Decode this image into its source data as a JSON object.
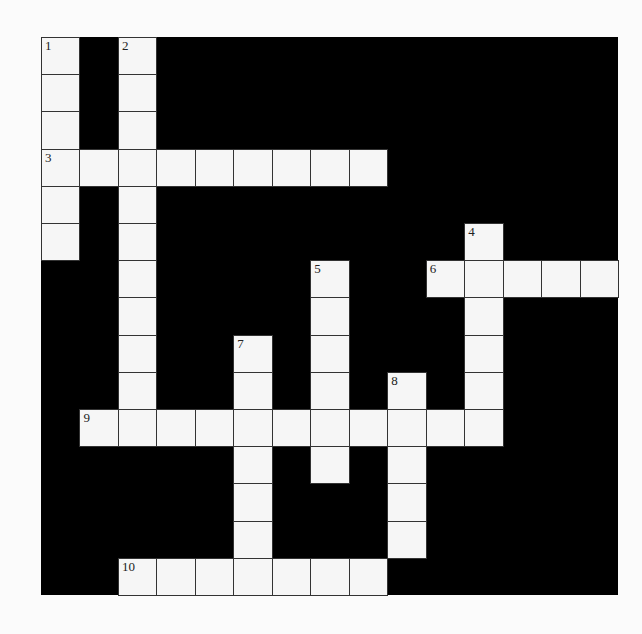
{
  "puzzle": {
    "type": "crossword",
    "rows": 15,
    "cols": 15,
    "colors": {
      "block": "#000000",
      "cell": "#f6f6f6",
      "grid_line": "#333333",
      "background": "#fbfbfb"
    },
    "entries": [
      {
        "number": "1",
        "direction": "down",
        "row": 0,
        "col": 0,
        "length": 6
      },
      {
        "number": "2",
        "direction": "down",
        "row": 0,
        "col": 2,
        "length": 11
      },
      {
        "number": "3",
        "direction": "across",
        "row": 3,
        "col": 0,
        "length": 9
      },
      {
        "number": "4",
        "direction": "down",
        "row": 5,
        "col": 11,
        "length": 6
      },
      {
        "number": "5",
        "direction": "down",
        "row": 6,
        "col": 7,
        "length": 6
      },
      {
        "number": "6",
        "direction": "across",
        "row": 6,
        "col": 10,
        "length": 5
      },
      {
        "number": "7",
        "direction": "down",
        "row": 8,
        "col": 5,
        "length": 7
      },
      {
        "number": "8",
        "direction": "down",
        "row": 9,
        "col": 9,
        "length": 5
      },
      {
        "number": "9",
        "direction": "across",
        "row": 10,
        "col": 1,
        "length": 11
      },
      {
        "number": "10",
        "direction": "across",
        "row": 14,
        "col": 2,
        "length": 7
      }
    ]
  }
}
